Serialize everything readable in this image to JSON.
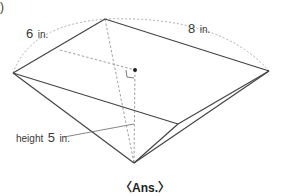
{
  "figure": {
    "marker": ")",
    "labels": {
      "side_a": {
        "value": "6",
        "unit": "in."
      },
      "side_b": {
        "value": "8",
        "unit": "in."
      },
      "height": {
        "prefix": "height",
        "value": "5",
        "unit": "in."
      }
    },
    "answer_label": "〈Ans.〉",
    "colors": {
      "edge": "#444444",
      "hidden": "#888888"
    }
  }
}
